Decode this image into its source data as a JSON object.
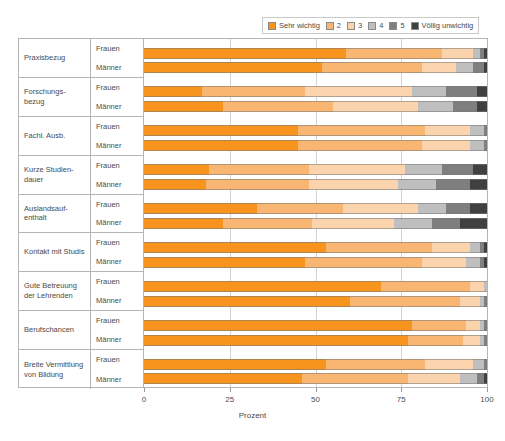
{
  "legend": {
    "items": [
      {
        "label": "Sehr wichtig",
        "color": "#F7941E"
      },
      {
        "label": "2",
        "color": "#F9B572"
      },
      {
        "label": "3",
        "color": "#FBD3AC"
      },
      {
        "label": "4",
        "color": "#BFBFBF"
      },
      {
        "label": "5",
        "color": "#7F7F7F"
      },
      {
        "label": "Völlig unwichtig",
        "color": "#404040"
      }
    ]
  },
  "axis": {
    "x_title": "Prozent",
    "x_ticks": [
      "0",
      "25",
      "50",
      "75",
      "100"
    ],
    "x_min": 0,
    "x_max": 100
  },
  "chart_data": {
    "type": "bar",
    "orientation": "horizontal",
    "stacked": true,
    "stack_mode": "percent",
    "title": "",
    "xlabel": "Prozent",
    "ylabel": "",
    "xlim": [
      0,
      100
    ],
    "grid": true,
    "legend_position": "top-right",
    "series": [
      {
        "name": "Sehr wichtig",
        "color": "#F7941E"
      },
      {
        "name": "2",
        "color": "#F9B572"
      },
      {
        "name": "3",
        "color": "#FBD3AC"
      },
      {
        "name": "4",
        "color": "#BFBFBF"
      },
      {
        "name": "5",
        "color": "#7F7F7F"
      },
      {
        "name": "Völlig unwichtig",
        "color": "#404040"
      }
    ],
    "categories": [
      "Praxisbezug",
      "Forschungs-\nbezug",
      "Fachl. Ausb.",
      "Kurze Studien-\ndauer",
      "Auslandsauf-\nenthalt",
      "Kontakt mit Studis",
      "Gute Betreuung\nder Lehrenden",
      "Berufschancen",
      "Breite Vermittlung\nvon Bildung"
    ],
    "subgroups": [
      "Frauen",
      "Männer"
    ],
    "groups": [
      {
        "category": "Praxisbezug",
        "rows": [
          {
            "subgroup": "Frauen",
            "values": [
              59,
              28,
              9,
              2,
              1,
              1
            ]
          },
          {
            "subgroup": "Männer",
            "values": [
              52,
              29,
              10,
              5,
              3,
              1
            ]
          }
        ]
      },
      {
        "category": "Forschungs-bezug",
        "rows": [
          {
            "subgroup": "Frauen",
            "values": [
              17,
              30,
              31,
              10,
              9,
              3
            ]
          },
          {
            "subgroup": "Männer",
            "values": [
              23,
              32,
              25,
              10,
              7,
              3
            ]
          }
        ]
      },
      {
        "category": "Fachl. Ausb.",
        "rows": [
          {
            "subgroup": "Frauen",
            "values": [
              45,
              37,
              13,
              4,
              1,
              0
            ]
          },
          {
            "subgroup": "Männer",
            "values": [
              45,
              36,
              14,
              4,
              1,
              0
            ]
          }
        ]
      },
      {
        "category": "Kurze Studien-dauer",
        "rows": [
          {
            "subgroup": "Frauen",
            "values": [
              19,
              29,
              28,
              11,
              9,
              4
            ]
          },
          {
            "subgroup": "Männer",
            "values": [
              18,
              30,
              26,
              11,
              10,
              5
            ]
          }
        ]
      },
      {
        "category": "Auslandsauf-enthalt",
        "rows": [
          {
            "subgroup": "Frauen",
            "values": [
              33,
              25,
              22,
              8,
              7,
              5
            ]
          },
          {
            "subgroup": "Männer",
            "values": [
              23,
              26,
              24,
              11,
              8,
              8
            ]
          }
        ]
      },
      {
        "category": "Kontakt mit Studis",
        "rows": [
          {
            "subgroup": "Frauen",
            "values": [
              53,
              31,
              11,
              3,
              1,
              1
            ]
          },
          {
            "subgroup": "Männer",
            "values": [
              47,
              34,
              13,
              4,
              1,
              1
            ]
          }
        ]
      },
      {
        "category": "Gute Betreuung der Lehrenden",
        "rows": [
          {
            "subgroup": "Frauen",
            "values": [
              69,
              26,
              4,
              1,
              0,
              0
            ]
          },
          {
            "subgroup": "Männer",
            "values": [
              60,
              32,
              6,
              1,
              1,
              0
            ]
          }
        ]
      },
      {
        "category": "Berufschancen",
        "rows": [
          {
            "subgroup": "Frauen",
            "values": [
              78,
              16,
              4,
              1,
              1,
              0
            ]
          },
          {
            "subgroup": "Männer",
            "values": [
              77,
              16,
              5,
              1,
              1,
              0
            ]
          }
        ]
      },
      {
        "category": "Breite Vermittlung von Bildung",
        "rows": [
          {
            "subgroup": "Frauen",
            "values": [
              53,
              29,
              14,
              3,
              1,
              0
            ]
          },
          {
            "subgroup": "Männer",
            "values": [
              46,
              31,
              15,
              5,
              2,
              1
            ]
          }
        ]
      }
    ]
  }
}
